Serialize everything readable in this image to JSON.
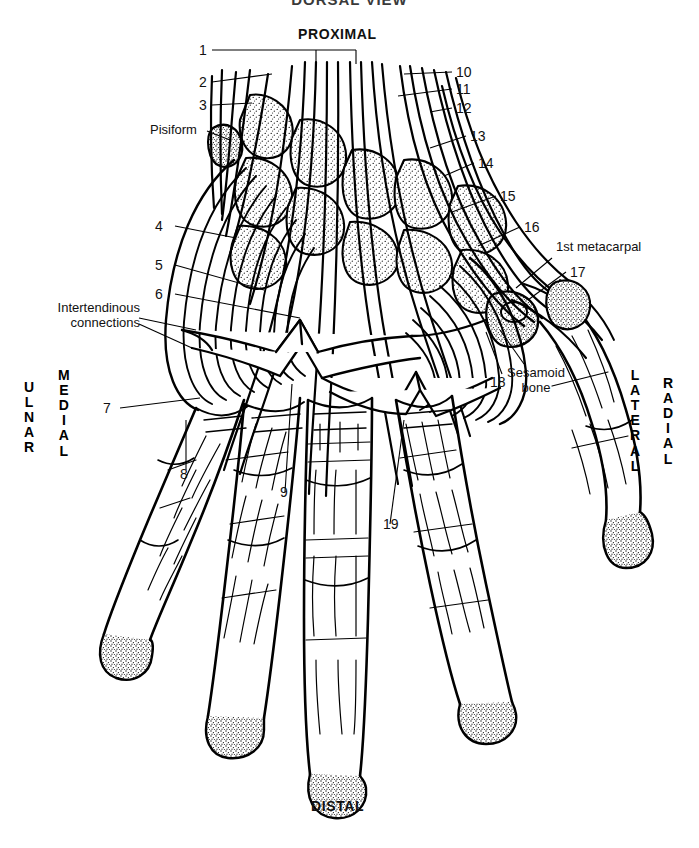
{
  "figure": {
    "title_partial": "DORSAL VIEW",
    "orientation": {
      "top": "PROXIMAL",
      "bottom": "DISTAL",
      "left_outer": "ULNAR",
      "left_inner": "MEDIAL",
      "right_inner": "LATERAL",
      "right_outer": "RADIAL"
    },
    "ink_color": "#000000",
    "background_color": "#ffffff"
  },
  "numbered_labels": {
    "left": [
      {
        "n": "1"
      },
      {
        "n": "2"
      },
      {
        "n": "3"
      },
      {
        "n": "4"
      },
      {
        "n": "5"
      },
      {
        "n": "6"
      },
      {
        "n": "7"
      },
      {
        "n": "8"
      },
      {
        "n": "9"
      }
    ],
    "right": [
      {
        "n": "10"
      },
      {
        "n": "11"
      },
      {
        "n": "12"
      },
      {
        "n": "13"
      },
      {
        "n": "14"
      },
      {
        "n": "15"
      },
      {
        "n": "16"
      },
      {
        "n": "17"
      },
      {
        "n": "18"
      },
      {
        "n": "19"
      }
    ]
  },
  "named_labels": {
    "pisiform": "Pisiform",
    "intertendinous_line1": "Intertendinous",
    "intertendinous_line2": "connections",
    "first_metacarpal": "1st metacarpal",
    "sesamoid_line1": "Sesamoid",
    "sesamoid_line2": "bone"
  }
}
